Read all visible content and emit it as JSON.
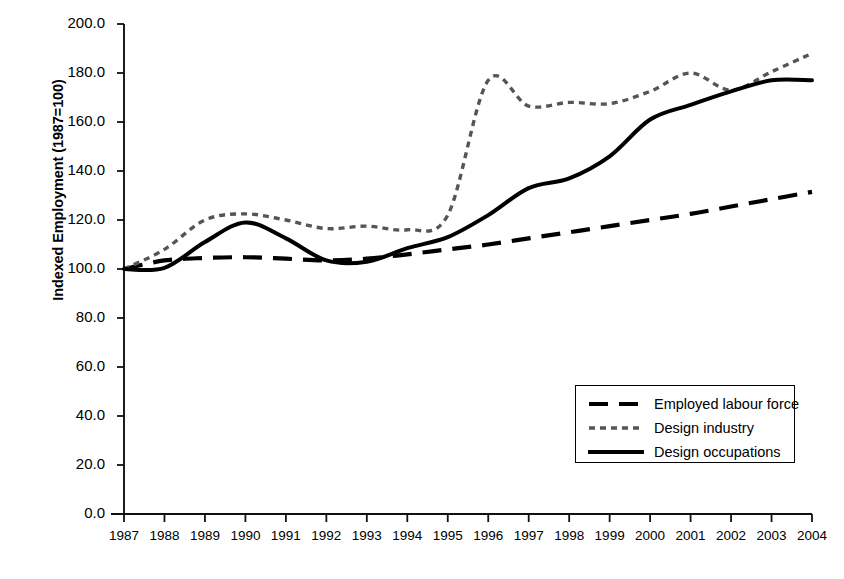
{
  "chart_data": {
    "type": "line",
    "title": "",
    "xlabel": "",
    "ylabel": "Indexed Employment (1987=100)",
    "xlim": [
      1987,
      2004
    ],
    "ylim": [
      0,
      200
    ],
    "grid": false,
    "legend_position": "lower right",
    "categories": [
      1987,
      1988,
      1989,
      1990,
      1991,
      1992,
      1993,
      1994,
      1995,
      1996,
      1997,
      1998,
      1999,
      2000,
      2001,
      2002,
      2003,
      2004
    ],
    "x_tick_labels": [
      "1987",
      "1988",
      "1989",
      "1990",
      "1991",
      "1992",
      "1993",
      "1994",
      "1995",
      "1996",
      "1997",
      "1998",
      "1999",
      "2000",
      "2001",
      "2002",
      "2003",
      "2004"
    ],
    "y_tick_labels": [
      "0.0",
      "20.0",
      "40.0",
      "60.0",
      "80.0",
      "100.0",
      "120.0",
      "140.0",
      "160.0",
      "180.0",
      "200.0"
    ],
    "y_tick_values": [
      0,
      20,
      40,
      60,
      80,
      100,
      120,
      140,
      160,
      180,
      200
    ],
    "series": [
      {
        "name": "Employed labour force",
        "style": "long-dash",
        "color": "#000000",
        "values": [
          100.0,
          103.5,
          104.5,
          104.8,
          104.2,
          103.5,
          104.2,
          106.0,
          108.0,
          110.0,
          112.5,
          115.0,
          117.5,
          120.0,
          122.5,
          125.5,
          128.5,
          131.5
        ]
      },
      {
        "name": "Design industry",
        "style": "dotted",
        "color": "#555555",
        "values": [
          100.0,
          108.0,
          120.0,
          122.5,
          120.0,
          116.5,
          117.5,
          116.0,
          122.0,
          177.0,
          166.5,
          168.0,
          167.5,
          172.5,
          180.0,
          173.0,
          180.5,
          188.0
        ]
      },
      {
        "name": "Design occupations",
        "style": "solid",
        "color": "#000000",
        "values": [
          100.0,
          100.5,
          111.0,
          119.0,
          112.5,
          103.5,
          103.0,
          108.5,
          113.0,
          122.0,
          133.0,
          137.0,
          146.0,
          161.0,
          167.0,
          172.5,
          177.0,
          177.0
        ]
      }
    ]
  },
  "legend": {
    "items": [
      {
        "label": "Employed labour force",
        "style": "long-dash"
      },
      {
        "label": "Design industry",
        "style": "dotted"
      },
      {
        "label": "Design occupations",
        "style": "solid"
      }
    ]
  }
}
